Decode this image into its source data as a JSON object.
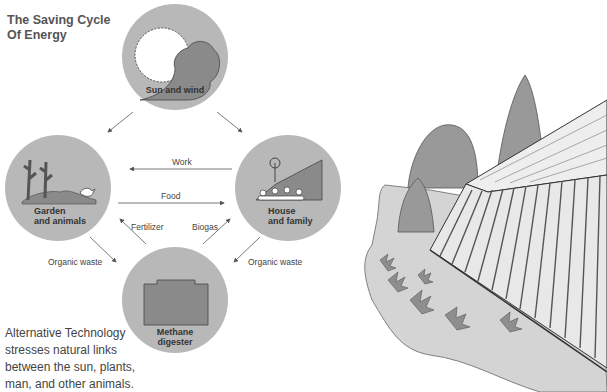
{
  "title": {
    "line1": "The Saving Cycle",
    "line2": "Of Energy"
  },
  "nodes": {
    "sun": {
      "label": "Sun and wind"
    },
    "garden": {
      "line1": "Garden",
      "line2": "and animals"
    },
    "house": {
      "line1": "House",
      "line2": "and family"
    },
    "digester": {
      "line1": "Methane",
      "line2": "digester"
    }
  },
  "flows": {
    "work": "Work",
    "food": "Food",
    "fertilizer": "Fertilizer",
    "biogas": "Biogas",
    "waste_left": "Organic waste",
    "waste_right": "Organic waste"
  },
  "caption": [
    "Alternative Technology",
    "stresses natural links",
    "between the sun, plants,",
    "man, and other animals."
  ],
  "colors": {
    "circle": "#b8b8b8",
    "dark": "#8a8a8a",
    "ground": "#c9c9c9"
  }
}
